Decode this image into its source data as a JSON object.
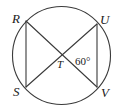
{
  "figure": {
    "type": "circle-with-intersecting-chords",
    "width": 122,
    "height": 110,
    "background_color": "#ffffff",
    "stroke_color": "#3a3a3a",
    "text_color": "#1a1a1a",
    "circle": {
      "name": "circle-outline",
      "center_x": 61.5,
      "center_y": 55.5,
      "radius": 49
    },
    "points": [
      {
        "id": "R",
        "label": "R",
        "x": 26,
        "y": 21,
        "label_x": 12,
        "label_y": 12
      },
      {
        "id": "U",
        "label": "U",
        "x": 97,
        "y": 24,
        "label_x": 100,
        "label_y": 13
      },
      {
        "id": "S",
        "label": "S",
        "x": 26,
        "y": 87,
        "label_x": 13,
        "label_y": 85
      },
      {
        "id": "V",
        "label": "V",
        "x": 97,
        "y": 87,
        "label_x": 101,
        "label_y": 86
      },
      {
        "id": "T",
        "label": "T",
        "x": 62,
        "y": 55,
        "label_x": 57,
        "label_y": 59
      }
    ],
    "segments": [
      {
        "name": "chord-RS",
        "from": "R",
        "to": "S",
        "x1": 26,
        "y1": 21,
        "x2": 26,
        "y2": 87
      },
      {
        "name": "chord-UV",
        "from": "U",
        "to": "V",
        "x1": 97,
        "y1": 24,
        "x2": 97,
        "y2": 87
      },
      {
        "name": "chord-RV",
        "from": "R",
        "to": "V",
        "x1": 26,
        "y1": 21,
        "x2": 97,
        "y2": 87
      },
      {
        "name": "chord-SU",
        "from": "S",
        "to": "U",
        "x1": 26,
        "y1": 87,
        "x2": 97,
        "y2": 24
      }
    ],
    "angle_label": {
      "name": "angle-measure-VTU",
      "text": "60°",
      "value": 60,
      "unit": "degrees",
      "at_vertex": "T",
      "label_x": 75,
      "label_y": 56
    }
  }
}
